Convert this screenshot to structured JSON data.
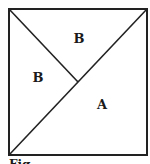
{
  "figure": {
    "frame": {
      "x1": 9,
      "y1": 9,
      "x2": 147,
      "y2": 155
    },
    "stroke_color": "#222222",
    "background": "#ffffff",
    "lines": [
      {
        "name": "main-diagonal",
        "from": [
          9,
          155
        ],
        "to": [
          147,
          9
        ]
      },
      {
        "name": "partition-line",
        "from": [
          9,
          9
        ],
        "to": [
          78,
          82
        ]
      }
    ],
    "regions": [
      {
        "label": "B",
        "x": 79,
        "y": 38
      },
      {
        "label": "B",
        "x": 38,
        "y": 77
      },
      {
        "label": "A",
        "x": 102,
        "y": 104
      }
    ],
    "caption": "Fig"
  }
}
